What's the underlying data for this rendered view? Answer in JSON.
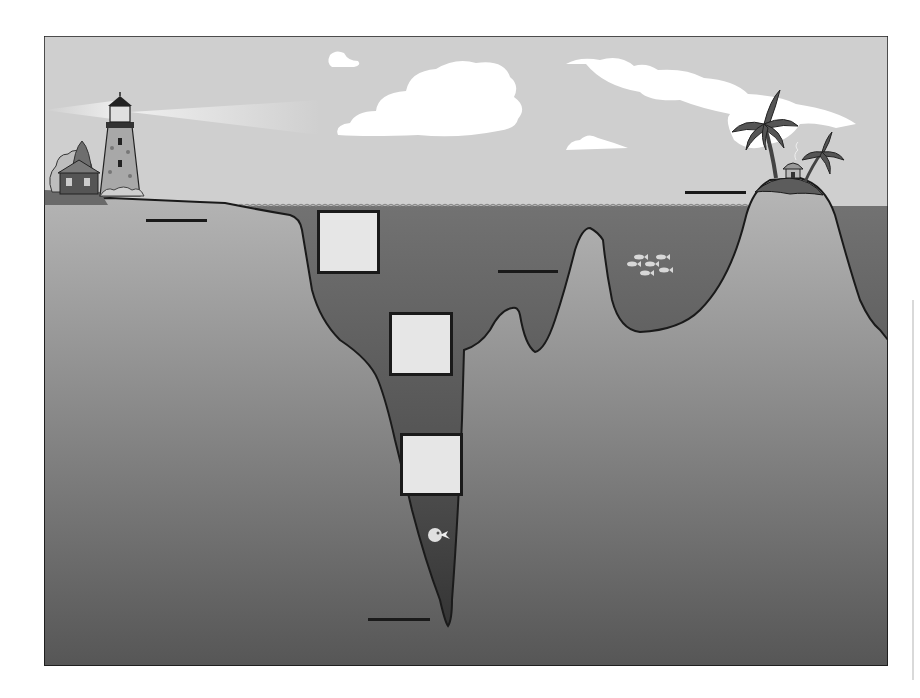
{
  "diagram": {
    "type": "ocean-floor-cross-section",
    "style": "greyscale worksheet",
    "colors": {
      "sky": "#cfcfcf",
      "cloud": "#ffffff",
      "water": "#6e6e6e",
      "water_deep": "#3c3c3c",
      "land_top": "#b4b4b4",
      "land_bottom": "#5a5a5a",
      "outline": "#1a1a1a",
      "box_fill": "#e6e6e6"
    },
    "scene_elements": [
      "lighthouse",
      "house-with-trees",
      "clouds",
      "palm-island-with-hut",
      "fish-school",
      "deep-sea-fish",
      "continental-shelf",
      "ocean-trench",
      "seamount",
      "volcanic-island"
    ],
    "answer_boxes": [
      {
        "id": 1,
        "text": ""
      },
      {
        "id": 2,
        "text": ""
      },
      {
        "id": 3,
        "text": ""
      }
    ],
    "label_lines": [
      {
        "id": 1,
        "text": ""
      },
      {
        "id": 2,
        "text": ""
      },
      {
        "id": 3,
        "text": ""
      },
      {
        "id": 4,
        "text": ""
      }
    ]
  }
}
